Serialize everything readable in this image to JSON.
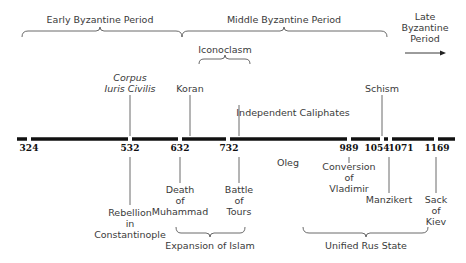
{
  "periods": {
    "early": "Early Byzantine Period",
    "middle": "Middle Byzantine Period",
    "late": [
      "Late",
      "Byzantine",
      "Period"
    ],
    "iconoclasm": "Iconoclasm",
    "independent_caliphates": "Independent Caliphates",
    "expansion_of_islam": "Expansion of Islam",
    "unified_rus_state": "Unified Rus State"
  },
  "years": [
    {
      "label": "324",
      "x": 29
    },
    {
      "label": "532",
      "x": 130
    },
    {
      "label": "632",
      "x": 180
    },
    {
      "label": "732",
      "x": 228
    },
    {
      "label": "989",
      "x": 349
    },
    {
      "label": "1054",
      "x": 380
    },
    {
      "label": "1071",
      "x": 397
    },
    {
      "label": "1169",
      "x": 437
    }
  ],
  "events_above": {
    "corpus": [
      "Corpus",
      "Iuris Civilis"
    ],
    "koran": "Koran",
    "schism": "Schism"
  },
  "events_below": {
    "rebellion": [
      "Rebellion",
      "in",
      "Constantinople"
    ],
    "death_muhammad": [
      "Death",
      "of",
      "Muhammad"
    ],
    "battle_tours": [
      "Battle",
      "of",
      "Tours"
    ],
    "oleg": "Oleg",
    "conversion_vladimir": [
      "Conversion",
      "of",
      "Vladimir"
    ],
    "manzikert": "Manzikert",
    "sack_kiev": [
      "Sack",
      "of",
      "Kiev"
    ]
  },
  "colors": {
    "line": "#111111",
    "thin": "#444444",
    "text": "#3a3a3a"
  }
}
